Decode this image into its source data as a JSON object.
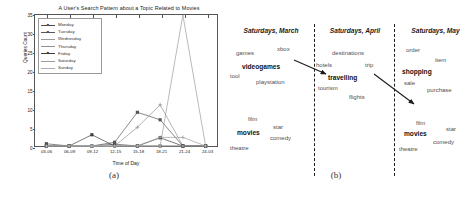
{
  "figure": {
    "subfigure_a_label": "(a)",
    "subfigure_b_label": "(b)"
  },
  "chart_data": {
    "type": "line",
    "title": "A User's Search Pattern about a Topic Related to Movies",
    "xlabel": "Time of Day",
    "ylabel": "Queries Count",
    "categories": [
      "03-06",
      "06-09",
      "09-12",
      "12-15",
      "15-18",
      "18-21",
      "21-24",
      "24-03"
    ],
    "yticks": [
      0,
      5,
      10,
      15,
      20,
      25,
      30,
      35
    ],
    "ylim": [
      0,
      35
    ],
    "grid": false,
    "legend_position": "upper left",
    "series": [
      {
        "name": "Monday",
        "marker": "square",
        "color": "#4d4d4d",
        "values": [
          0.6,
          0,
          0,
          0.5,
          0,
          0,
          0,
          0
        ]
      },
      {
        "name": "Tuesday",
        "marker": "square",
        "color": "#555555",
        "values": [
          0,
          0,
          0,
          1,
          9,
          7,
          0,
          0
        ]
      },
      {
        "name": "Wednesday",
        "marker": "none",
        "color": "#9a9a9a",
        "values": [
          0,
          0,
          0,
          0,
          0,
          0,
          35,
          0
        ]
      },
      {
        "name": "Thursday",
        "marker": "plus",
        "color": "#8f8f8f",
        "values": [
          0,
          0,
          0,
          0,
          5,
          11,
          0,
          0
        ]
      },
      {
        "name": "Friday",
        "marker": "square",
        "color": "#3f3f3f",
        "values": [
          0,
          0,
          3,
          0,
          0,
          2.2,
          0,
          0
        ]
      },
      {
        "name": "Saturday",
        "marker": "plus",
        "color": "#9d9d9d",
        "values": [
          0,
          0,
          0,
          0,
          0,
          2.3,
          2.3,
          0
        ]
      },
      {
        "name": "Sunday",
        "marker": "dot",
        "color": "#b0b0b0",
        "values": [
          0,
          0,
          0,
          0,
          0,
          0,
          0,
          0
        ]
      }
    ]
  },
  "wordclouds": {
    "columns": [
      {
        "heading": "Saturdays, March",
        "words": [
          {
            "text": "games",
            "bold": false,
            "x": 8,
            "y": 50
          },
          {
            "text": "xbox",
            "bold": false,
            "x": 49,
            "y": 46
          },
          {
            "text": "videogames",
            "bold": true,
            "x": 14,
            "y": 63
          },
          {
            "text": "tool",
            "bold": false,
            "x": 2,
            "y": 73
          },
          {
            "text": "playstation",
            "bold": false,
            "x": 28,
            "y": 79
          },
          {
            "text": "film",
            "bold": false,
            "x": 20,
            "y": 116
          },
          {
            "text": "star",
            "bold": false,
            "x": 45,
            "y": 124
          },
          {
            "text": "movies",
            "bold": true,
            "x": 9,
            "y": 129
          },
          {
            "text": "comedy",
            "bold": false,
            "x": 42,
            "y": 135
          },
          {
            "text": "theatre",
            "bold": false,
            "x": 2,
            "y": 145
          }
        ]
      },
      {
        "heading": "Saturdays, April",
        "words": [
          {
            "text": "destinations",
            "bold": false,
            "x": 16,
            "y": 50
          },
          {
            "text": "hotels",
            "bold": false,
            "x": 0,
            "y": 62
          },
          {
            "text": "trip",
            "bold": false,
            "x": 49,
            "y": 62
          },
          {
            "text": "travelling",
            "bold": true,
            "x": 12,
            "y": 74
          },
          {
            "text": "tourism",
            "bold": false,
            "x": 2,
            "y": 85
          },
          {
            "text": "flights",
            "bold": false,
            "x": 33,
            "y": 94
          }
        ]
      },
      {
        "heading": "Saturdays, May",
        "words": [
          {
            "text": "order",
            "bold": false,
            "x": 10,
            "y": 47
          },
          {
            "text": "item",
            "bold": false,
            "x": 39,
            "y": 57
          },
          {
            "text": "shopping",
            "bold": true,
            "x": 6,
            "y": 68
          },
          {
            "text": "sale",
            "bold": false,
            "x": 8,
            "y": 80
          },
          {
            "text": "purchase",
            "bold": false,
            "x": 31,
            "y": 87
          },
          {
            "text": "film",
            "bold": false,
            "x": 20,
            "y": 120
          },
          {
            "text": "star",
            "bold": false,
            "x": 50,
            "y": 126
          },
          {
            "text": "movies",
            "bold": true,
            "x": 8,
            "y": 130
          },
          {
            "text": "comedy",
            "bold": false,
            "x": 37,
            "y": 139
          },
          {
            "text": "theatre",
            "bold": false,
            "x": 3,
            "y": 146
          }
        ]
      }
    ]
  }
}
